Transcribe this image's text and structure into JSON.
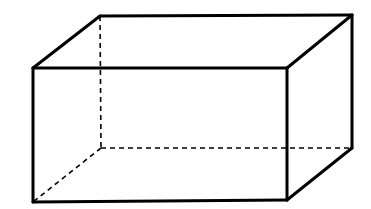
{
  "figure": {
    "type": "rectangular-prism-wireframe",
    "width": 371,
    "height": 209,
    "background": "#ffffff",
    "stroke_color": "#000000",
    "solid_stroke_width": 3,
    "dashed_stroke_width": 1.6,
    "dash_pattern": "5,4",
    "vertices": {
      "front_top_left": [
        33,
        68
      ],
      "front_top_right": [
        287,
        68
      ],
      "front_bottom_right": [
        287,
        200
      ],
      "front_bottom_left": [
        33,
        202
      ],
      "back_top_left": [
        100,
        16
      ],
      "back_top_right": [
        352,
        15
      ],
      "back_bottom_right": [
        352,
        148
      ],
      "back_bottom_left": [
        101,
        148
      ]
    },
    "visible_edges": [
      [
        "front_top_left",
        "front_top_right"
      ],
      [
        "front_top_right",
        "front_bottom_right"
      ],
      [
        "front_bottom_right",
        "front_bottom_left"
      ],
      [
        "front_bottom_left",
        "front_top_left"
      ],
      [
        "front_top_left",
        "back_top_left"
      ],
      [
        "back_top_left",
        "back_top_right"
      ],
      [
        "back_top_right",
        "front_top_right"
      ],
      [
        "back_top_right",
        "back_bottom_right"
      ],
      [
        "back_bottom_right",
        "front_bottom_right"
      ]
    ],
    "hidden_edges": [
      [
        "back_top_left",
        "back_bottom_left"
      ],
      [
        "back_bottom_left",
        "back_bottom_right"
      ],
      [
        "back_bottom_left",
        "front_bottom_left"
      ]
    ]
  }
}
